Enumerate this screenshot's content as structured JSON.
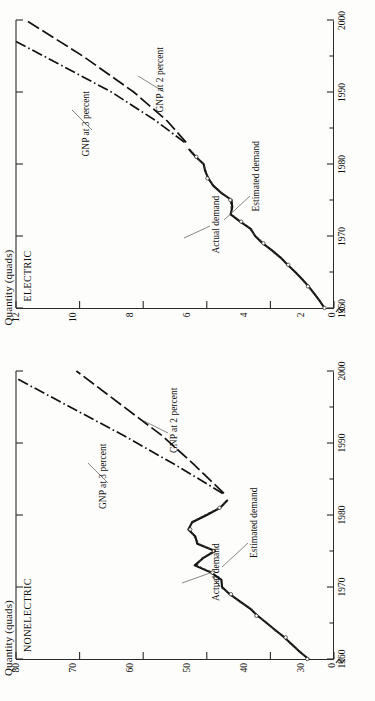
{
  "figure": {
    "orientation": "rotated-90-ccw",
    "axis_title": "Quantity (quads)"
  },
  "chart_data": [
    {
      "type": "line",
      "title": "ELECTRIC",
      "ylabel": "Quantity (quads)",
      "xlabel": "",
      "xlim": [
        1960,
        2000
      ],
      "ylim": [
        2,
        12
      ],
      "y_axis_break_at": 0,
      "x_ticks": [
        1960,
        1970,
        1980,
        1990,
        2000
      ],
      "x_minor_ticks": [
        1965,
        1975,
        1985,
        1995
      ],
      "y_ticks": [
        2,
        4,
        6,
        8,
        10,
        12
      ],
      "y_zero_label": "0",
      "grid": false,
      "legend": "inline-annotations",
      "series": [
        {
          "name": "Actual demand",
          "style": "solid-thick",
          "x": [
            1960,
            1961,
            1962,
            1963,
            1964,
            1965,
            1966,
            1967,
            1968,
            1969,
            1970,
            1971,
            1972,
            1973,
            1974,
            1975,
            1976,
            1977,
            1978,
            1979,
            1980,
            1981,
            1982
          ],
          "values": [
            2.3,
            2.45,
            2.62,
            2.8,
            3.0,
            3.22,
            3.46,
            3.68,
            3.95,
            4.25,
            4.48,
            4.62,
            4.95,
            5.25,
            5.2,
            5.22,
            5.55,
            5.8,
            5.95,
            6.05,
            6.1,
            6.35,
            6.55
          ]
        },
        {
          "name": "Estimated demand",
          "style": "dotted-thin",
          "x": [
            1960,
            1961,
            1962,
            1963,
            1964,
            1965,
            1966,
            1967,
            1968,
            1969,
            1970,
            1971,
            1972,
            1973,
            1974,
            1975,
            1976,
            1977,
            1978,
            1979,
            1980,
            1981,
            1982
          ],
          "values": [
            2.3,
            2.46,
            2.64,
            2.82,
            3.02,
            3.24,
            3.44,
            3.7,
            3.98,
            4.22,
            4.46,
            4.66,
            4.92,
            5.22,
            5.24,
            5.26,
            5.52,
            5.78,
            5.98,
            6.02,
            6.12,
            6.33,
            6.52
          ]
        },
        {
          "name": "GNP at 3 percent",
          "style": "dash-dot",
          "x": [
            1983,
            1986,
            1990,
            1994,
            1997
          ],
          "values": [
            6.7,
            7.6,
            9.0,
            10.7,
            12.0
          ]
        },
        {
          "name": "GNP at 2 percent",
          "style": "long-dash",
          "x": [
            1983,
            1986,
            1990,
            1995,
            2000
          ],
          "values": [
            6.65,
            7.25,
            8.3,
            9.9,
            11.7
          ]
        }
      ],
      "annotations": [
        {
          "text": "Actual demand",
          "near_x": 1969,
          "near_y": 4.3
        },
        {
          "text": "Estimated demand",
          "near_x": 1971,
          "near_y": 4.8
        },
        {
          "text": "GNP at 3 percent",
          "near_x": 1992,
          "near_y": 9.8
        },
        {
          "text": "GNP at 2 percent",
          "near_x": 1993,
          "near_y": 7.6
        }
      ]
    },
    {
      "type": "line",
      "title": "NONELECTRIC",
      "ylabel": "Quantity (quads)",
      "xlabel": "",
      "xlim": [
        1960,
        2000
      ],
      "ylim": [
        30,
        80
      ],
      "y_axis_break_at": 0,
      "x_ticks": [
        1960,
        1970,
        1980,
        1990,
        2000
      ],
      "x_minor_ticks": [
        1965,
        1975,
        1985,
        1995
      ],
      "y_ticks": [
        30,
        40,
        50,
        60,
        70,
        80
      ],
      "y_zero_label": "0",
      "grid": false,
      "legend": "inline-annotations",
      "series": [
        {
          "name": "Actual demand",
          "style": "solid-thick",
          "x": [
            1960,
            1961,
            1962,
            1963,
            1964,
            1965,
            1966,
            1967,
            1968,
            1969,
            1970,
            1971,
            1972,
            1973,
            1974,
            1975,
            1976,
            1977,
            1978,
            1979,
            1980,
            1981,
            1982
          ],
          "values": [
            34.0,
            35.4,
            36.6,
            37.8,
            39.2,
            40.6,
            42.0,
            43.2,
            44.8,
            46.4,
            47.6,
            47.7,
            49.3,
            51.9,
            50.6,
            48.7,
            51.5,
            51.8,
            52.9,
            52.3,
            50.0,
            47.9,
            46.8
          ]
        },
        {
          "name": "Estimated demand",
          "style": "dotted-thin",
          "x": [
            1960,
            1961,
            1962,
            1963,
            1964,
            1965,
            1966,
            1967,
            1968,
            1969,
            1970,
            1971,
            1972,
            1973,
            1974,
            1975,
            1976,
            1977,
            1978,
            1979,
            1980,
            1981,
            1982
          ],
          "values": [
            34.2,
            35.2,
            36.8,
            37.6,
            39.4,
            40.4,
            42.2,
            43.0,
            45.0,
            46.2,
            47.9,
            48.8,
            49.1,
            51.5,
            50.8,
            48.9,
            51.2,
            52.0,
            52.6,
            52.5,
            50.3,
            48.0,
            46.9
          ]
        },
        {
          "name": "GNP at 3 percent",
          "style": "dash-dot",
          "x": [
            1983,
            1987,
            1991,
            1995,
            1999
          ],
          "values": [
            47.5,
            55.0,
            63.0,
            71.5,
            80.0
          ]
        },
        {
          "name": "GNP at 2 percent",
          "style": "long-dash",
          "x": [
            1983,
            1987,
            1991,
            1995,
            2000
          ],
          "values": [
            47.3,
            52.0,
            57.0,
            63.0,
            70.5
          ]
        }
      ],
      "annotations": [
        {
          "text": "Actual demand",
          "near_x": 1971,
          "near_y": 48.5
        },
        {
          "text": "Estimated demand",
          "near_x": 1972,
          "near_y": 45.5
        },
        {
          "text": "GNP at 3 percent",
          "near_x": 1990,
          "near_y": 66.0
        },
        {
          "text": "GNP at 2 percent",
          "near_x": 1993,
          "near_y": 55.0
        }
      ]
    }
  ],
  "panels": {
    "electric": {
      "name": "ELECTRIC",
      "axis_title": "Quantity (quads)",
      "y_ticks": [
        "12",
        "10",
        "8",
        "6",
        "4",
        "2"
      ],
      "y_zero": "0",
      "x_ticks": [
        "1960",
        "1970",
        "1980",
        "1990",
        "2000"
      ],
      "annotations": {
        "actual": "Actual demand",
        "estimated": "Estimated demand",
        "gnp3": "GNP at 3 percent",
        "gnp2": "GNP at 2 percent"
      }
    },
    "nonelectric": {
      "name": "NONELECTRIC",
      "axis_title": "Quantity (quads)",
      "y_ticks": [
        "80",
        "70",
        "60",
        "50",
        "40",
        "30"
      ],
      "y_zero": "0",
      "x_ticks": [
        "1960",
        "1970",
        "1980",
        "1990",
        "2000"
      ],
      "annotations": {
        "actual": "Actual demand",
        "estimated": "Estimated demand",
        "gnp3": "GNP at 3 percent",
        "gnp2": "GNP at 2 percent"
      }
    }
  }
}
